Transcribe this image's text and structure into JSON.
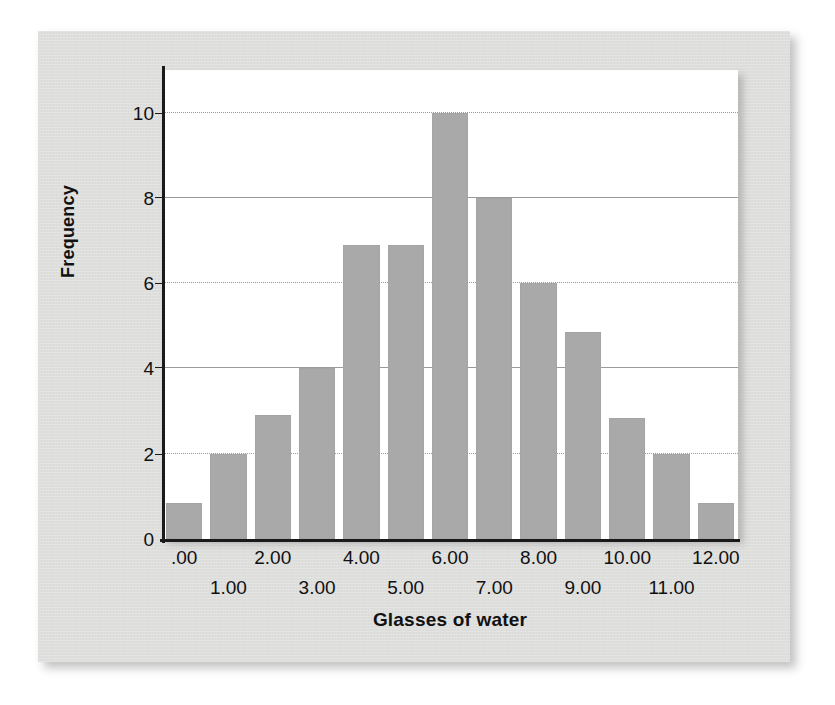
{
  "chart_data": {
    "type": "bar",
    "title": "",
    "subtitle": "",
    "xlabel": "Glasses of water",
    "ylabel": "Frequency",
    "categories": [
      ".00",
      "1.00",
      "2.00",
      "3.00",
      "4.00",
      "5.00",
      "6.00",
      "7.00",
      "8.00",
      "9.00",
      "10.00",
      "11.00",
      "12.00"
    ],
    "values": [
      0.85,
      2,
      2.9,
      4,
      6.9,
      6.9,
      10,
      8,
      6,
      4.85,
      2.85,
      2,
      0.85
    ],
    "x_tick_labels_top_row": [
      ".00",
      "2.00",
      "4.00",
      "6.00",
      "8.00",
      "10.00",
      "12.00"
    ],
    "x_tick_labels_bottom_row": [
      "1.00",
      "3.00",
      "5.00",
      "7.00",
      "9.00",
      "11.00"
    ],
    "y_tick_labels": [
      "0",
      "2",
      "4",
      "6",
      "8",
      "10"
    ],
    "y_ticks": [
      0,
      2,
      4,
      6,
      8,
      10
    ],
    "ylim": [
      0,
      11
    ],
    "grid": "horizontal",
    "legend": "none",
    "bar_color": "#a9a9a9",
    "plot_background": "#ffffff",
    "card_background": "#dededd",
    "axis_color": "#1a1a1a",
    "gridline_color": "#9a9a9a",
    "text_color": "#111111"
  }
}
